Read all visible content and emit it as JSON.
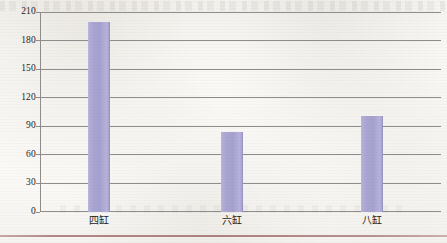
{
  "chart_data": {
    "type": "bar",
    "title": "",
    "xlabel": "",
    "ylabel": "",
    "categories": [
      "四缸",
      "六缸",
      "八缸"
    ],
    "values": [
      200,
      84,
      101
    ],
    "series": [
      {
        "name": "",
        "values": [
          200,
          84,
          101
        ]
      }
    ],
    "ylim": [
      0,
      210
    ],
    "yticks": [
      0,
      30,
      60,
      90,
      120,
      150,
      180,
      210
    ],
    "ytick_labels": [
      "0",
      "30",
      "60",
      "90",
      "120",
      "150",
      "180",
      "210"
    ],
    "grid": true,
    "grid_axis": "y",
    "legend": false,
    "legend_position": "none",
    "bar_color": "#a9a5d2",
    "axis_color": "#8d8d8d",
    "background_color": "#fbfaf7",
    "rule_color": "#a87878"
  }
}
